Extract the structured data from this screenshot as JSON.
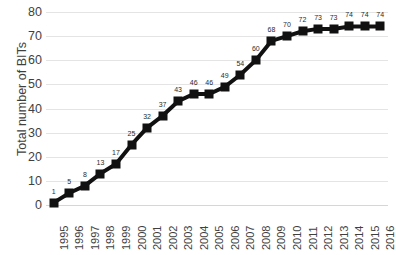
{
  "chart_data": {
    "type": "line",
    "title": "",
    "xlabel": "",
    "ylabel": "Total number of BITs",
    "categories": [
      "1995",
      "1996",
      "1997",
      "1998",
      "1999",
      "2000",
      "2001",
      "2002",
      "2003",
      "2004",
      "2005",
      "2006",
      "2007",
      "2008",
      "2009",
      "2010",
      "2011",
      "2012",
      "2013",
      "2014",
      "2015",
      "2016"
    ],
    "values": [
      1,
      5,
      8,
      13,
      17,
      25,
      32,
      37,
      43,
      46,
      46,
      49,
      54,
      60,
      68,
      70,
      72,
      73,
      73,
      74,
      74,
      74
    ],
    "data_labels": [
      "1",
      "5",
      "8",
      "13",
      "17",
      "25",
      "32",
      "37",
      "43",
      "46",
      "46",
      "49",
      "54",
      "60",
      "68",
      "70",
      "72",
      "73",
      "73",
      "74",
      "74",
      "74"
    ],
    "ylim": [
      0,
      80
    ],
    "yticks": [
      0,
      10,
      20,
      30,
      40,
      50,
      60,
      70,
      80
    ],
    "ytick_labels": [
      "0",
      "10",
      "20",
      "30",
      "40",
      "50",
      "60",
      "70",
      "80"
    ],
    "grid": "horizontal",
    "legend": "none",
    "series_color": "#111111",
    "marker": "square",
    "grid_color": "#e4e4e4",
    "text_color": "#3f3f3f",
    "background": "#ffffff"
  }
}
